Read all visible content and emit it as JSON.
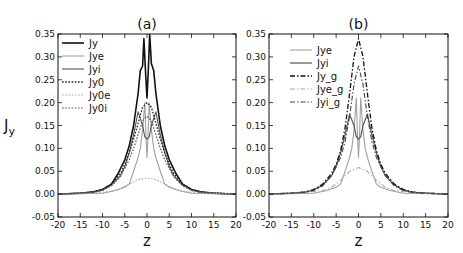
{
  "chart_data": [
    {
      "type": "line",
      "title": "(a)",
      "xlabel": "z",
      "ylabel": "Jy",
      "xlim": [
        -20,
        20
      ],
      "ylim": [
        -0.05,
        0.35
      ],
      "xticks": [
        -20,
        -15,
        -10,
        -5,
        0,
        5,
        10,
        15,
        20
      ],
      "yticks": [
        -0.05,
        0.0,
        0.05,
        0.1,
        0.15,
        0.2,
        0.25,
        0.3,
        0.35
      ],
      "ytick_labels": [
        "-0.05",
        "0.00",
        "0.05",
        "0.10",
        "0.15",
        "0.20",
        "0.25",
        "0.30",
        "0.35"
      ],
      "grid": false,
      "legend_position": "upper left",
      "series": [
        {
          "name": "Jy",
          "style": "solid",
          "color": "#111111",
          "width": 1.6,
          "x": [
            -20,
            -15,
            -12,
            -10,
            -8,
            -6.5,
            -5,
            -4,
            -3,
            -2,
            -1.5,
            -1,
            -0.7,
            -0.3,
            0,
            0.3,
            0.6,
            1,
            1.5,
            2,
            3,
            4,
            5,
            6.5,
            8,
            10,
            12,
            15,
            20
          ],
          "y": [
            0.0,
            0.002,
            0.005,
            0.01,
            0.022,
            0.045,
            0.075,
            0.105,
            0.15,
            0.22,
            0.27,
            0.28,
            0.34,
            0.26,
            0.21,
            0.27,
            0.35,
            0.285,
            0.27,
            0.22,
            0.15,
            0.105,
            0.075,
            0.045,
            0.022,
            0.01,
            0.005,
            0.002,
            0.0
          ]
        },
        {
          "name": "Jye",
          "style": "solid",
          "color": "#a0a0a0",
          "width": 1.1,
          "x": [
            -20,
            -10,
            -7,
            -5,
            -4,
            -3,
            -2,
            -1.5,
            -1,
            -0.5,
            -0.2,
            0,
            0.2,
            0.5,
            1,
            1.5,
            2,
            3,
            4,
            5,
            7,
            10,
            20
          ],
          "y": [
            0.0,
            0.002,
            0.008,
            0.015,
            0.022,
            0.05,
            0.08,
            0.1,
            0.14,
            0.2,
            0.12,
            0.08,
            0.12,
            0.2,
            0.14,
            0.1,
            0.08,
            0.05,
            0.022,
            0.015,
            0.008,
            0.002,
            0.0
          ]
        },
        {
          "name": "Jyi",
          "style": "solid",
          "color": "#555555",
          "width": 1.1,
          "x": [
            -20,
            -12,
            -10,
            -8,
            -6,
            -5,
            -4,
            -3,
            -2,
            -1,
            -0.5,
            0,
            0.5,
            1,
            2,
            3,
            4,
            5,
            6,
            8,
            10,
            12,
            20
          ],
          "y": [
            0.0,
            0.004,
            0.009,
            0.02,
            0.04,
            0.06,
            0.09,
            0.13,
            0.18,
            0.15,
            0.125,
            0.12,
            0.125,
            0.15,
            0.18,
            0.13,
            0.09,
            0.06,
            0.04,
            0.02,
            0.009,
            0.004,
            0.0
          ]
        },
        {
          "name": "Jy0",
          "style": "dotted",
          "color": "#222222",
          "width": 1.3,
          "x": [
            -20,
            -15,
            -12,
            -10,
            -8,
            -6,
            -5,
            -4,
            -3,
            -2,
            -1,
            0,
            1,
            2,
            3,
            4,
            5,
            6,
            8,
            10,
            12,
            15,
            20
          ],
          "y": [
            0.0,
            0.002,
            0.005,
            0.01,
            0.022,
            0.045,
            0.065,
            0.09,
            0.12,
            0.155,
            0.19,
            0.2,
            0.19,
            0.155,
            0.12,
            0.09,
            0.065,
            0.045,
            0.022,
            0.01,
            0.005,
            0.002,
            0.0
          ]
        },
        {
          "name": "Jy0e",
          "style": "dotted",
          "color": "#a8a8a8",
          "width": 1.2,
          "x": [
            -20,
            -12,
            -8,
            -6,
            -4,
            -2,
            0,
            2,
            4,
            6,
            8,
            12,
            20
          ],
          "y": [
            0.0,
            0.002,
            0.006,
            0.012,
            0.022,
            0.032,
            0.035,
            0.032,
            0.022,
            0.012,
            0.006,
            0.002,
            0.0
          ]
        },
        {
          "name": "Jy0i",
          "style": "dotted",
          "color": "#555555",
          "width": 1.2,
          "x": [
            -20,
            -15,
            -12,
            -10,
            -8,
            -6,
            -4,
            -3,
            -2,
            -1,
            0,
            1,
            2,
            3,
            4,
            6,
            8,
            10,
            12,
            15,
            20
          ],
          "y": [
            0.0,
            0.002,
            0.004,
            0.008,
            0.018,
            0.038,
            0.075,
            0.1,
            0.13,
            0.16,
            0.17,
            0.16,
            0.13,
            0.1,
            0.075,
            0.038,
            0.018,
            0.008,
            0.004,
            0.002,
            0.0
          ]
        }
      ]
    },
    {
      "type": "line",
      "title": "(b)",
      "xlabel": "z",
      "ylabel": "",
      "xlim": [
        -20,
        20
      ],
      "ylim": [
        -0.05,
        0.35
      ],
      "xticks": [
        -20,
        -15,
        -10,
        -5,
        0,
        5,
        10,
        15,
        20
      ],
      "yticks": [
        -0.05,
        0.0,
        0.05,
        0.1,
        0.15,
        0.2,
        0.25,
        0.3,
        0.35
      ],
      "ytick_labels": [
        "-0.05",
        "0.00",
        "0.05",
        "0.10",
        "0.15",
        "0.20",
        "0.25",
        "0.30",
        "0.35"
      ],
      "grid": false,
      "legend_position": "upper left",
      "series": [
        {
          "name": "Jye",
          "style": "solid",
          "color": "#a0a0a0",
          "width": 1.1,
          "x": [
            -20,
            -10,
            -7,
            -5,
            -4,
            -3,
            -2,
            -1.5,
            -1,
            -0.5,
            -0.2,
            0,
            0.2,
            0.5,
            1,
            1.5,
            2,
            3,
            4,
            5,
            7,
            10,
            20
          ],
          "y": [
            0.0,
            0.002,
            0.008,
            0.015,
            0.022,
            0.05,
            0.08,
            0.1,
            0.14,
            0.21,
            0.12,
            0.08,
            0.12,
            0.21,
            0.14,
            0.1,
            0.08,
            0.05,
            0.022,
            0.015,
            0.008,
            0.002,
            0.0
          ]
        },
        {
          "name": "Jyi",
          "style": "solid",
          "color": "#555555",
          "width": 1.2,
          "x": [
            -20,
            -12,
            -10,
            -8,
            -6,
            -5,
            -4,
            -3,
            -2,
            -1,
            -0.5,
            0,
            0.5,
            1,
            2,
            3,
            4,
            5,
            6,
            8,
            10,
            12,
            20
          ],
          "y": [
            0.0,
            0.004,
            0.009,
            0.02,
            0.04,
            0.06,
            0.09,
            0.13,
            0.175,
            0.15,
            0.125,
            0.12,
            0.125,
            0.15,
            0.175,
            0.13,
            0.09,
            0.06,
            0.04,
            0.02,
            0.009,
            0.004,
            0.0
          ]
        },
        {
          "name": "Jy_g",
          "style": "dashdot",
          "color": "#111111",
          "width": 1.3,
          "x": [
            -20,
            -15,
            -12,
            -10,
            -8,
            -6,
            -5,
            -4,
            -3,
            -2,
            -1,
            0,
            1,
            2,
            3,
            4,
            5,
            6,
            8,
            10,
            12,
            15,
            20
          ],
          "y": [
            0.0,
            0.002,
            0.005,
            0.01,
            0.022,
            0.045,
            0.065,
            0.095,
            0.145,
            0.22,
            0.3,
            0.34,
            0.3,
            0.22,
            0.145,
            0.095,
            0.065,
            0.045,
            0.022,
            0.01,
            0.005,
            0.002,
            0.0
          ]
        },
        {
          "name": "Jye_g",
          "style": "dashdot",
          "color": "#aaaaaa",
          "width": 1.1,
          "x": [
            -20,
            -12,
            -8,
            -6,
            -4,
            -2,
            0,
            2,
            4,
            6,
            8,
            12,
            20
          ],
          "y": [
            0.0,
            0.003,
            0.008,
            0.015,
            0.03,
            0.05,
            0.058,
            0.05,
            0.03,
            0.015,
            0.008,
            0.003,
            0.0
          ]
        },
        {
          "name": "Jyi_g",
          "style": "dashdot",
          "color": "#444444",
          "width": 1.1,
          "x": [
            -20,
            -15,
            -12,
            -10,
            -8,
            -6,
            -4,
            -3,
            -2,
            -1,
            0,
            1,
            2,
            3,
            4,
            6,
            8,
            10,
            12,
            15,
            20
          ],
          "y": [
            0.0,
            0.002,
            0.004,
            0.008,
            0.018,
            0.04,
            0.08,
            0.115,
            0.17,
            0.24,
            0.28,
            0.24,
            0.17,
            0.115,
            0.08,
            0.04,
            0.018,
            0.008,
            0.004,
            0.002,
            0.0
          ]
        }
      ]
    }
  ],
  "panels": [
    {
      "title": "(a)",
      "xlabel": "z",
      "ylabel": "Jy",
      "legend": [
        "Jy",
        "Jye",
        "Jyi",
        "Jy0",
        "Jy0e",
        "Jy0i"
      ]
    },
    {
      "title": "(b)",
      "xlabel": "z",
      "legend": [
        "Jye",
        "Jyi",
        "Jy_g",
        "Jye_g",
        "Jyi_g"
      ]
    }
  ]
}
